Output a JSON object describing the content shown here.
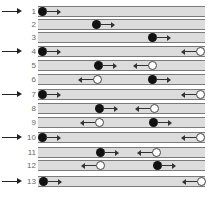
{
  "diagram": {
    "colors": {
      "strip_fill": "#dcdcdc",
      "strip_border": "#7a7a7a",
      "black_ball": "#111111",
      "white_ball": "#ffffff",
      "arrow": "#222222",
      "label": "#666666"
    },
    "rows": [
      {
        "label": "1",
        "top": 6,
        "marked": true,
        "black": {
          "x": 38
        },
        "white": null
      },
      {
        "label": "2",
        "top": 19,
        "marked": false,
        "black": {
          "x": 92
        },
        "white": null
      },
      {
        "label": "3",
        "top": 32,
        "marked": false,
        "black": {
          "x": 148
        },
        "white": null
      },
      {
        "label": "4",
        "top": 46,
        "marked": true,
        "black": {
          "x": 38
        },
        "white": {
          "x": 196
        }
      },
      {
        "label": "5",
        "top": 60,
        "marked": false,
        "black": {
          "x": 94
        },
        "white": {
          "x": 148
        }
      },
      {
        "label": "6",
        "top": 74,
        "marked": false,
        "black": {
          "x": 148
        },
        "white": {
          "x": 93
        }
      },
      {
        "label": "7",
        "top": 89,
        "marked": true,
        "black": {
          "x": 38
        },
        "white": {
          "x": 196
        }
      },
      {
        "label": "8",
        "top": 103,
        "marked": false,
        "black": {
          "x": 95
        },
        "white": {
          "x": 150
        }
      },
      {
        "label": "9",
        "top": 117,
        "marked": false,
        "black": {
          "x": 149
        },
        "white": {
          "x": 95
        }
      },
      {
        "label": "10",
        "top": 132,
        "marked": true,
        "black": {
          "x": 38
        },
        "white": {
          "x": 196
        }
      },
      {
        "label": "11",
        "top": 147,
        "marked": false,
        "black": {
          "x": 96
        },
        "white": {
          "x": 152
        }
      },
      {
        "label": "12",
        "top": 160,
        "marked": false,
        "black": {
          "x": 153
        },
        "white": {
          "x": 96
        }
      },
      {
        "label": "13",
        "top": 176,
        "marked": true,
        "black": {
          "x": 39
        },
        "white": {
          "x": 197
        }
      }
    ]
  }
}
